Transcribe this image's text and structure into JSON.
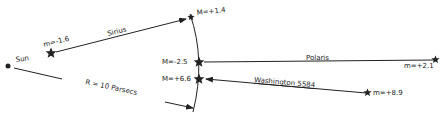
{
  "diagram": {
    "sun": {
      "label": "Sun"
    },
    "radius_label": "R = 10 Parsecs",
    "stars": [
      {
        "name": "Sirius",
        "apparent": "m=-1.6",
        "absolute": "M=+1.4"
      },
      {
        "name": "Polaris",
        "apparent": "m=+2.1",
        "absolute": "M=-2.5"
      },
      {
        "name": "Washington 5584",
        "apparent": "m=+8.9",
        "absolute": "M=+6.6"
      }
    ]
  },
  "colors": {
    "ink": "#222222",
    "background": "#ffffff"
  }
}
